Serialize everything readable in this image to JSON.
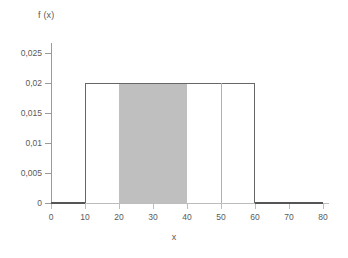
{
  "chart_data": {
    "type": "area",
    "title": "",
    "xlabel": "x",
    "ylabel": "f (x)",
    "xlim": [
      0,
      80
    ],
    "ylim": [
      0,
      0.02667
    ],
    "grid": false,
    "legend": null,
    "x_ticks": [
      {
        "value": 0,
        "label": "0"
      },
      {
        "value": 10,
        "label": "10"
      },
      {
        "value": 20,
        "label": "20"
      },
      {
        "value": 30,
        "label": "30"
      },
      {
        "value": 40,
        "label": "40"
      },
      {
        "value": 50,
        "label": "50"
      },
      {
        "value": 60,
        "label": "60"
      },
      {
        "value": 70,
        "label": "70"
      },
      {
        "value": 80,
        "label": "80"
      }
    ],
    "y_ticks": [
      {
        "value": 0,
        "label": "0"
      },
      {
        "value": 0.005,
        "label": "0,005"
      },
      {
        "value": 0.01,
        "label": "0,01"
      },
      {
        "value": 0.015,
        "label": "0,015"
      },
      {
        "value": 0.02,
        "label": "0,02"
      },
      {
        "value": 0.025,
        "label": "0,025"
      }
    ],
    "series": [
      {
        "name": "f(x) uniform density",
        "kind": "step",
        "x": [
          0,
          10,
          10,
          60,
          60,
          80
        ],
        "values": [
          0,
          0,
          0.02,
          0.02,
          0,
          0
        ],
        "color": "#666666"
      }
    ],
    "distribution": {
      "family": "uniform",
      "a": 10,
      "b": 60,
      "density": 0.02
    },
    "shaded_regions": [
      {
        "name": "probability-area",
        "x_from": 20,
        "x_to": 40,
        "y_from": 0,
        "y_to": 0.02,
        "color": "#bfbfbf"
      }
    ],
    "reference_lines": [
      {
        "name": "vertical-line-at-50",
        "orientation": "vertical",
        "x": 50,
        "y_from": 0,
        "y_to": 0.02,
        "color": "#b0b0b0"
      }
    ]
  },
  "colors": {
    "background": "#ffffff",
    "axis": "#bdbdbd",
    "y_axis": "#9a9a9a",
    "curve": "#666666",
    "shade": "#bfbfbf",
    "text": "#5a5a5a"
  }
}
